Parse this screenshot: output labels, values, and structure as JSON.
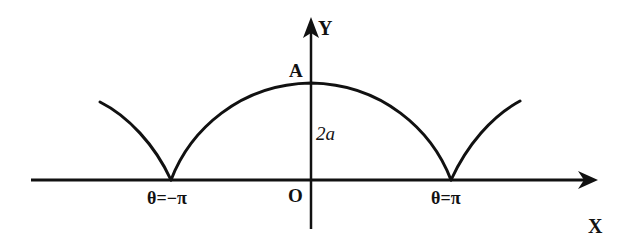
{
  "diagram": {
    "type": "cycloid-curve",
    "labels": {
      "x_axis": "X",
      "y_axis": "Y",
      "origin": "O",
      "peak": "A",
      "height": "2a",
      "left_cusp": "θ=−π",
      "right_cusp": "θ=π"
    },
    "colors": {
      "stroke": "#111111",
      "background": "#ffffff"
    }
  }
}
